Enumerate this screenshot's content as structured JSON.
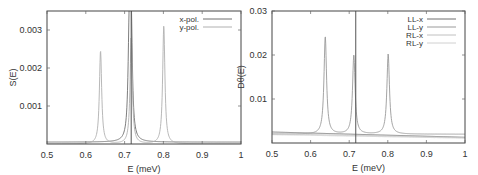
{
  "chart_data": [
    {
      "type": "line",
      "panel": "left",
      "title": "",
      "xlabel": "E (meV)",
      "ylabel": "S(E)",
      "xlim": [
        0.5,
        1.0
      ],
      "ylim": [
        0,
        0.0035
      ],
      "xticks": [
        "0.5",
        "0.6",
        "0.7",
        "0.8",
        "0.9",
        "1"
      ],
      "yticks": [
        "0.001",
        "0.002",
        "0.003"
      ],
      "grid": false,
      "legend_position": "top-right",
      "vline_x": 0.717,
      "series": [
        {
          "name": "x-pol.",
          "color": "#6e6e6e",
          "peaks": [
            {
              "x": 0.712,
              "y": 0.0027
            },
            {
              "x": 0.717,
              "y": 0.0029
            }
          ],
          "baseline": 5e-05
        },
        {
          "name": "y-pol.",
          "color": "#b0b0b0",
          "peaks": [
            {
              "x": 0.638,
              "y": 0.00245
            },
            {
              "x": 0.717,
              "y": 0.0028
            },
            {
              "x": 0.801,
              "y": 0.0031
            }
          ],
          "baseline": 0.0
        }
      ]
    },
    {
      "type": "line",
      "panel": "right",
      "title": "",
      "xlabel": "E (meV)",
      "ylabel": "D_θ(E)",
      "xlim": [
        0.5,
        1.0
      ],
      "ylim": [
        0,
        0.03
      ],
      "xticks": [
        "0.5",
        "0.6",
        "0.7",
        "0.8",
        "0.9",
        "1"
      ],
      "yticks": [
        "0.01",
        "0.02",
        "0.03"
      ],
      "grid": false,
      "legend_position": "top-right",
      "vline_x": 0.717,
      "series": [
        {
          "name": "LL-x",
          "color": "#6e6e6e",
          "baseline_start": 0.0025,
          "baseline_end": 0.0013
        },
        {
          "name": "LL-y",
          "color": "#9a9a9a",
          "peaks": [
            {
              "x": 0.638,
              "y": 0.0222
            },
            {
              "x": 0.712,
              "y": 0.018
            },
            {
              "x": 0.801,
              "y": 0.0182
            }
          ],
          "baseline": 0.002
        },
        {
          "name": "RL-x",
          "color": "#c0c0c0",
          "baseline_start": 0.0021,
          "baseline_end": 0.0012
        },
        {
          "name": "RL-y",
          "color": "#d0d0d0",
          "baseline_start": 0.0019,
          "baseline_end": 0.0011
        }
      ]
    }
  ]
}
